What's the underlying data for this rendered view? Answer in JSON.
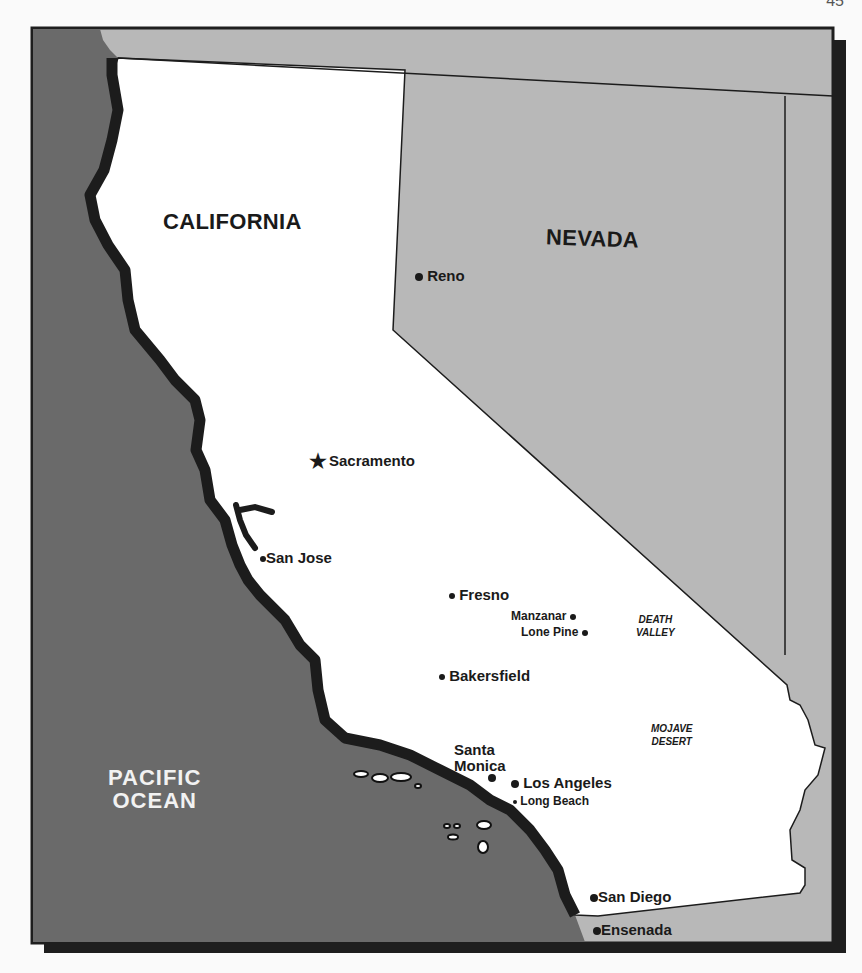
{
  "page": {
    "number": "45"
  },
  "colors": {
    "ocean": "#6a6a6a",
    "neighbor_states": "#b8b8b8",
    "california": "#ffffff",
    "coastline": "#1c1c1c",
    "frame_shadow": "#1e1e1e",
    "text": "#1a1a1a",
    "ocean_text": "#f2f2f2"
  },
  "map": {
    "states": [
      {
        "name": "CALIFORNIA"
      },
      {
        "name": "NEVADA"
      }
    ],
    "ocean": {
      "line1": "PACIFIC",
      "line2": "OCEAN"
    },
    "regions": [
      {
        "line1": "DEATH",
        "line2": "VALLEY"
      },
      {
        "line1": "MOJAVE",
        "line2": "DESERT"
      }
    ],
    "cities": [
      {
        "name": "Reno",
        "marker": "dot"
      },
      {
        "name": "Sacramento",
        "marker": "star"
      },
      {
        "name": "San Jose",
        "marker": "dot"
      },
      {
        "name": "Fresno",
        "marker": "dot"
      },
      {
        "name": "Manzanar",
        "marker": "dot"
      },
      {
        "name": "Lone Pine",
        "marker": "dot"
      },
      {
        "name": "Bakersfield",
        "marker": "dot"
      },
      {
        "name": "Santa",
        "name2": "Monica",
        "marker": "dot"
      },
      {
        "name": "Los Angeles",
        "marker": "dot"
      },
      {
        "name": "Long Beach",
        "marker": "dot"
      },
      {
        "name": "San Diego",
        "marker": "dot"
      },
      {
        "name": "Ensenada",
        "marker": "dot"
      }
    ],
    "icons": {
      "capital": "★"
    }
  }
}
